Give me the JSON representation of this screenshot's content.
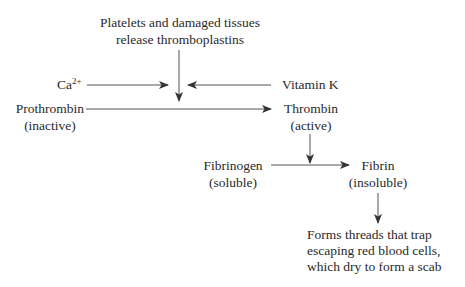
{
  "diagram": {
    "nodes": {
      "thromboplastins": {
        "line1": "Platelets and damaged tissues",
        "line2": "release thromboplastins"
      },
      "calcium": {
        "base": "Ca",
        "superscript": "2+"
      },
      "vitamin_k": {
        "label": "Vitamin K"
      },
      "prothrombin": {
        "label": "Prothrombin",
        "state": "(inactive)"
      },
      "thrombin": {
        "label": "Thrombin",
        "state": "(active)"
      },
      "fibrinogen": {
        "label": "Fibrinogen",
        "state": "(soluble)"
      },
      "fibrin": {
        "label": "Fibrin",
        "state": "(insoluble)"
      },
      "outcome": {
        "line1": "Forms threads that trap",
        "line2": "escaping red blood cells,",
        "line3": "which dry to form a scab"
      }
    },
    "edges": [
      {
        "from": "thromboplastins",
        "to": "prothrombin-to-thrombin",
        "direction": "down"
      },
      {
        "from": "calcium",
        "to": "prothrombin-to-thrombin",
        "direction": "right"
      },
      {
        "from": "vitamin_k",
        "to": "prothrombin-to-thrombin",
        "direction": "left"
      },
      {
        "from": "prothrombin",
        "to": "thrombin",
        "direction": "right"
      },
      {
        "from": "thrombin",
        "to": "fibrinogen-to-fibrin",
        "direction": "down"
      },
      {
        "from": "fibrinogen",
        "to": "fibrin",
        "direction": "right"
      },
      {
        "from": "fibrin",
        "to": "outcome",
        "direction": "down"
      }
    ],
    "colors": {
      "text": "#2a2a2a",
      "arrow": "#333333",
      "background": "#ffffff"
    }
  }
}
